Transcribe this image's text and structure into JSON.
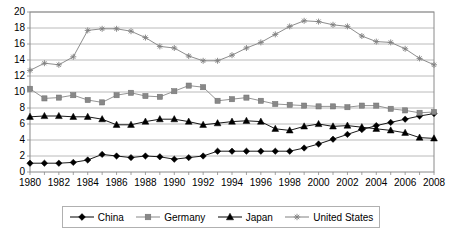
{
  "chart_data": {
    "type": "line",
    "title": "",
    "xlabel": "",
    "ylabel": "",
    "xlim": [
      1980,
      2008
    ],
    "ylim": [
      0,
      20
    ],
    "ytick_step": 2,
    "xtick_step": 2,
    "grid": true,
    "legend_position": "bottom",
    "x": [
      1980,
      1981,
      1982,
      1983,
      1984,
      1985,
      1986,
      1987,
      1988,
      1989,
      1990,
      1991,
      1992,
      1993,
      1994,
      1995,
      1996,
      1997,
      1998,
      1999,
      2000,
      2001,
      2002,
      2003,
      2004,
      2005,
      2006,
      2007,
      2008
    ],
    "xticks": [
      1980,
      1982,
      1984,
      1986,
      1988,
      1990,
      1992,
      1994,
      1996,
      1998,
      2000,
      2002,
      2004,
      2006,
      2008
    ],
    "xtick_labels": [
      "1980",
      "1982",
      "1984",
      "1986",
      "1988",
      "1990",
      "1992",
      "1994",
      "1996",
      "1998",
      "2000",
      "2002",
      "2004",
      "2006",
      "2008"
    ],
    "yticks": [
      0,
      2,
      4,
      6,
      8,
      10,
      12,
      14,
      16,
      18,
      20
    ],
    "ytick_labels": [
      "0",
      "2",
      "4",
      "6",
      "8",
      "10",
      "12",
      "14",
      "16",
      "18",
      "20"
    ],
    "series": [
      {
        "name": "China",
        "marker": "diamond",
        "color": "#000000",
        "values": [
          1.1,
          1.1,
          1.1,
          1.2,
          1.5,
          2.2,
          2.0,
          1.8,
          2.0,
          1.9,
          1.6,
          1.8,
          2.0,
          2.6,
          2.6,
          2.6,
          2.6,
          2.6,
          2.6,
          3.0,
          3.5,
          4.1,
          4.7,
          5.3,
          5.8,
          6.2,
          6.6,
          7.0,
          7.3
        ]
      },
      {
        "name": "Germany",
        "marker": "square",
        "color": "#888888",
        "values": [
          10.4,
          9.2,
          9.3,
          9.6,
          9.0,
          8.7,
          9.6,
          9.9,
          9.5,
          9.4,
          10.1,
          10.8,
          10.6,
          8.9,
          9.1,
          9.3,
          8.9,
          8.5,
          8.4,
          8.3,
          8.2,
          8.2,
          8.1,
          8.3,
          8.3,
          7.9,
          7.7,
          7.4,
          7.5
        ]
      },
      {
        "name": "Japan",
        "marker": "triangle",
        "color": "#000000",
        "values": [
          6.9,
          7.0,
          7.0,
          6.9,
          6.9,
          6.6,
          5.9,
          5.9,
          6.3,
          6.6,
          6.6,
          6.3,
          5.9,
          6.1,
          6.3,
          6.4,
          6.3,
          5.4,
          5.2,
          5.7,
          6.0,
          5.7,
          5.8,
          5.6,
          5.4,
          5.2,
          4.9,
          4.3,
          4.2
        ]
      },
      {
        "name": "United States",
        "marker": "star",
        "color": "#808080",
        "values": [
          12.7,
          13.6,
          13.4,
          14.4,
          17.7,
          17.9,
          17.9,
          17.6,
          16.8,
          15.7,
          15.5,
          14.5,
          13.9,
          13.9,
          14.6,
          15.5,
          16.2,
          17.2,
          18.2,
          18.9,
          18.8,
          18.4,
          18.2,
          17.0,
          16.3,
          16.2,
          15.4,
          14.2,
          13.4
        ]
      }
    ]
  },
  "legend": {
    "items": [
      {
        "label": "China"
      },
      {
        "label": "Germany"
      },
      {
        "label": "Japan"
      },
      {
        "label": "United States"
      }
    ]
  }
}
